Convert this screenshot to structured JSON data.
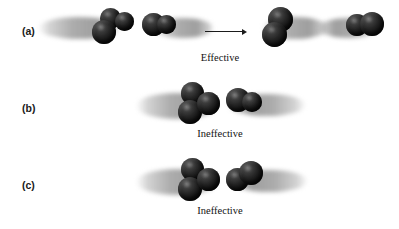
{
  "figure": {
    "background_color": "#ffffff",
    "atom_color": "#1a1a1a",
    "streak_color": "#9e9e9e"
  },
  "rows": [
    {
      "label": "(a)",
      "caption": "Effective",
      "outcome": "effective",
      "arrow": {
        "name": "reaction-arrow",
        "direction": "right"
      }
    },
    {
      "label": "(b)",
      "caption": "Ineffective",
      "outcome": "ineffective",
      "arrow": null
    },
    {
      "label": "(c)",
      "caption": "Ineffective",
      "outcome": "ineffective",
      "arrow": null
    }
  ]
}
